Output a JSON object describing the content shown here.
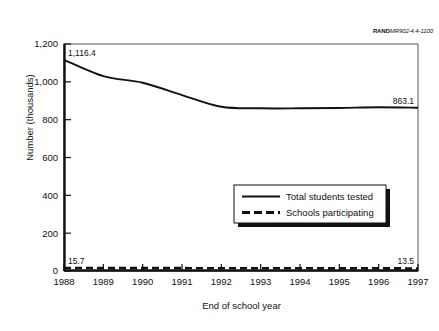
{
  "figure": {
    "source_id_bold": "RAND",
    "source_id_rest": "MR902-4.4-1100"
  },
  "chart_data": {
    "type": "line",
    "title": "",
    "xlabel": "End of school year",
    "ylabel": "Number (thousands)",
    "x": [
      1988,
      1989,
      1990,
      1991,
      1992,
      1993,
      1994,
      1995,
      1996,
      1997
    ],
    "xtick_labels": [
      "1988",
      "1989",
      "1990",
      "1991",
      "1992",
      "1993",
      "1994",
      "1995",
      "1996",
      "1997"
    ],
    "ytick_labels": [
      "0",
      "200",
      "400",
      "600",
      "800",
      "1,000",
      "1,200"
    ],
    "ytick_values": [
      0,
      200,
      400,
      600,
      800,
      1000,
      1200
    ],
    "ylim": [
      0,
      1200
    ],
    "xlim": [
      1988,
      1997
    ],
    "grid": false,
    "legend_position": "center-right",
    "series": [
      {
        "name": "Total students tested",
        "style": "solid",
        "values": [
          1116.4,
          1030.0,
          995.0,
          930.0,
          868.0,
          860.0,
          860.0,
          862.0,
          866.0,
          863.1
        ]
      },
      {
        "name": "Schools participating",
        "style": "dashed",
        "values": [
          15.7,
          15.4,
          15.2,
          15.0,
          14.7,
          14.4,
          14.2,
          14.0,
          13.8,
          13.5
        ]
      }
    ],
    "annotations": [
      {
        "text": "1,116.4",
        "series": "Total students tested",
        "x": 1988,
        "y": 1116.4
      },
      {
        "text": "863.1",
        "series": "Total students tested",
        "x": 1997,
        "y": 863.1
      },
      {
        "text": "15.7",
        "series": "Schools participating",
        "x": 1988,
        "y": 15.7
      },
      {
        "text": "13.5",
        "series": "Schools participating",
        "x": 1997,
        "y": 13.5
      }
    ]
  }
}
